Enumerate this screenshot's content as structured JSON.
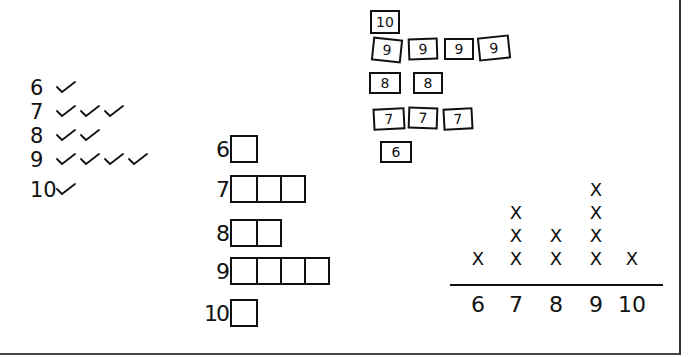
{
  "figure": {
    "ink_color": "#111111",
    "background_color": "#ffffff"
  },
  "tally_list": {
    "rows": [
      {
        "label": "6",
        "checks": 1
      },
      {
        "label": "7",
        "checks": 3
      },
      {
        "label": "8",
        "checks": 2
      },
      {
        "label": "9",
        "checks": 4
      },
      {
        "label": "10",
        "checks": 1
      }
    ]
  },
  "cards": {
    "rows": [
      {
        "value": "10",
        "cards": [
          "10"
        ]
      },
      {
        "value": "9",
        "cards": [
          "9",
          "9",
          "9",
          "9"
        ]
      },
      {
        "value": "8",
        "cards": [
          "8",
          "8"
        ]
      },
      {
        "value": "7",
        "cards": [
          "7",
          "7",
          "7"
        ]
      },
      {
        "value": "6",
        "cards": [
          "6"
        ]
      }
    ]
  },
  "box_graph": {
    "rows": [
      {
        "label": "6",
        "boxes": 1
      },
      {
        "label": "7",
        "boxes": 3
      },
      {
        "label": "8",
        "boxes": 2
      },
      {
        "label": "9",
        "boxes": 4
      },
      {
        "label": "10",
        "boxes": 1
      }
    ]
  },
  "line_plot": {
    "mark": "X",
    "ticks": [
      "6",
      "7",
      "8",
      "9",
      "10"
    ],
    "counts": [
      1,
      3,
      2,
      4,
      1
    ]
  },
  "chart_data": [
    {
      "type": "table",
      "title": "",
      "representation": "tally checkmarks",
      "categories": [
        "6",
        "7",
        "8",
        "9",
        "10"
      ],
      "values": [
        1,
        3,
        2,
        4,
        1
      ]
    },
    {
      "type": "table",
      "representation": "number cards",
      "categories": [
        "10",
        "9",
        "8",
        "7",
        "6"
      ],
      "values": [
        1,
        4,
        2,
        3,
        1
      ]
    },
    {
      "type": "bar",
      "representation": "horizontal box bar graph",
      "orientation": "horizontal",
      "categories": [
        "6",
        "7",
        "8",
        "9",
        "10"
      ],
      "values": [
        1,
        3,
        2,
        4,
        1
      ],
      "xlabel": "",
      "ylabel": ""
    },
    {
      "type": "scatter",
      "representation": "line plot (dot plot with X marks)",
      "categories": [
        "6",
        "7",
        "8",
        "9",
        "10"
      ],
      "values": [
        1,
        3,
        2,
        4,
        1
      ],
      "xlabel": "",
      "ylabel": "",
      "grid": false
    }
  ]
}
